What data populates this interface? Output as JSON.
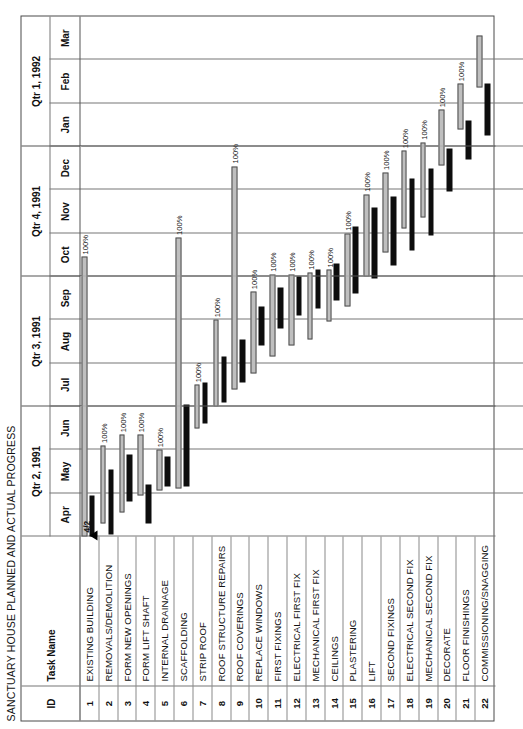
{
  "document": {
    "title": "SANCTUARY HOUSE PLANNED AND ACTUAL PROGRESS"
  },
  "table_headers": {
    "id": "ID",
    "task_name": "Task Name"
  },
  "milestone": {
    "label": "4/2",
    "marker": "triangle-up"
  },
  "timeline": {
    "quarters": [
      {
        "label": "Qtr 2, 1991",
        "months": [
          "Apr",
          "May",
          "Jun"
        ]
      },
      {
        "label": "Qtr 3, 1991",
        "months": [
          "Jul",
          "Aug",
          "Sep"
        ]
      },
      {
        "label": "Qtr 4, 1991",
        "months": [
          "Oct",
          "Nov",
          "Dec"
        ]
      },
      {
        "label": "Qtr 1, 1992",
        "months": [
          "Jan",
          "Feb",
          "Mar"
        ]
      }
    ],
    "months_flat": [
      "Apr",
      "May",
      "Jun",
      "Jul",
      "Aug",
      "Sep",
      "Oct",
      "Nov",
      "Dec",
      "Jan",
      "Feb",
      "Mar"
    ],
    "start": "Apr 1991",
    "end": "Mar 1992"
  },
  "legend": {
    "planned_color": "#bfbfbf",
    "actual_color": "#0d0d0d",
    "planned_label": "Planned",
    "actual_label": "Actual"
  },
  "chart_data": {
    "type": "bar",
    "title": "SANCTUARY HOUSE PLANNED AND ACTUAL PROGRESS",
    "xlabel": "",
    "ylabel": "Task Name",
    "orientation": "gantt",
    "x_unit": "month",
    "x": [
      "Apr",
      "May",
      "Jun",
      "Jul",
      "Aug",
      "Sep",
      "Oct",
      "Nov",
      "Dec",
      "Jan",
      "Feb",
      "Mar"
    ],
    "xlim": [
      0,
      12
    ],
    "grid": true,
    "legend": [
      "Planned",
      "Actual"
    ],
    "series": [
      {
        "name": "Planned",
        "color": "#bfbfbf"
      },
      {
        "name": "Actual",
        "color": "#0d0d0d"
      }
    ],
    "categories": [
      "EXISTING BUILDING",
      "REMOVALS/DEMOLITION",
      "FORM NEW OPENINGS",
      "FORM LIFT SHAFT",
      "INTERNAL DRAINAGE",
      "SCAFFOLDING",
      "STRIP ROOF",
      "ROOF STRUCTURE REPAIRS",
      "ROOF COVERINGS",
      "REPLACE WINDOWS",
      "FIRST FIXINGS",
      "ELECTRICAL FIRST FIX",
      "MECHANICAL FIRST FIX",
      "CEILINGS",
      "PLASTERING",
      "LIFT",
      "SECOND FIXINGS",
      "ELECTRICAL SECOND FIX",
      "MECHANICAL SECOND FIX",
      "DECORATE",
      "FLOOR FINISHINGS",
      "COMMISSIONING/SNAGGING"
    ],
    "tasks": [
      {
        "id": "1",
        "name": "EXISTING BUILDING",
        "planned_start": 0.0,
        "planned_end": 6.45,
        "actual_start": 0.0,
        "actual_end": 0.95,
        "percent": "100%"
      },
      {
        "id": "2",
        "name": "REMOVALS/DEMOLITION",
        "planned_start": 0.3,
        "planned_end": 2.1,
        "actual_start": 0.05,
        "actual_end": 1.55,
        "percent": "100%"
      },
      {
        "id": "3",
        "name": "FORM NEW OPENINGS",
        "planned_start": 0.55,
        "planned_end": 2.35,
        "actual_start": 0.8,
        "actual_end": 1.9,
        "percent": "100%"
      },
      {
        "id": "4",
        "name": "FORM LIFT SHAFT",
        "planned_start": 0.95,
        "planned_end": 2.35,
        "actual_start": 0.3,
        "actual_end": 1.2,
        "percent": "100%"
      },
      {
        "id": "5",
        "name": "INTERNAL DRAINAGE",
        "planned_start": 1.05,
        "planned_end": 2.0,
        "actual_start": 1.15,
        "actual_end": 1.85,
        "percent": "100%"
      },
      {
        "id": "6",
        "name": "SCAFFOLDING",
        "planned_start": 1.1,
        "planned_end": 6.9,
        "actual_start": 1.15,
        "actual_end": 3.05,
        "percent": "100%"
      },
      {
        "id": "7",
        "name": "STRIP ROOF",
        "planned_start": 2.5,
        "planned_end": 3.5,
        "actual_start": 2.6,
        "actual_end": 3.55,
        "percent": "100%"
      },
      {
        "id": "8",
        "name": "ROOF STRUCTURE REPAIRS",
        "planned_start": 3.0,
        "planned_end": 5.0,
        "actual_start": 3.1,
        "actual_end": 4.15,
        "percent": "100%"
      },
      {
        "id": "9",
        "name": "ROOF COVERINGS",
        "planned_start": 3.4,
        "planned_end": 8.55,
        "actual_start": 3.55,
        "actual_end": 4.55,
        "percent": "100%"
      },
      {
        "id": "10",
        "name": "REPLACE WINDOWS",
        "planned_start": 3.75,
        "planned_end": 5.65,
        "actual_start": 4.4,
        "actual_end": 5.3,
        "percent": "100%"
      },
      {
        "id": "11",
        "name": "FIRST FIXINGS",
        "planned_start": 4.15,
        "planned_end": 6.05,
        "actual_start": 4.8,
        "actual_end": 5.75,
        "percent": "100%"
      },
      {
        "id": "12",
        "name": "ELECTRICAL FIRST FIX",
        "planned_start": 4.4,
        "planned_end": 6.05,
        "actual_start": 5.1,
        "actual_end": 6.0,
        "percent": "100%"
      },
      {
        "id": "13",
        "name": "MECHANICAL FIRST FIX",
        "planned_start": 4.55,
        "planned_end": 6.1,
        "actual_start": 5.25,
        "actual_end": 6.15,
        "percent": "100%"
      },
      {
        "id": "14",
        "name": "CEILINGS",
        "planned_start": 4.95,
        "planned_end": 6.15,
        "actual_start": 5.45,
        "actual_end": 6.3,
        "percent": "100%"
      },
      {
        "id": "15",
        "name": "PLASTERING",
        "planned_start": 5.3,
        "planned_end": 7.0,
        "actual_start": 5.6,
        "actual_end": 7.15,
        "percent": "100%"
      },
      {
        "id": "16",
        "name": "LIFT",
        "planned_start": 6.0,
        "planned_end": 7.9,
        "actual_start": 5.95,
        "actual_end": 7.6,
        "percent": "100%"
      },
      {
        "id": "17",
        "name": "SECOND FIXINGS",
        "planned_start": 6.55,
        "planned_end": 8.4,
        "actual_start": 6.25,
        "actual_end": 7.85,
        "percent": "100%"
      },
      {
        "id": "18",
        "name": "ELECTRICAL SECOND FIX",
        "planned_start": 7.1,
        "planned_end": 8.9,
        "actual_start": 6.6,
        "actual_end": 8.25,
        "percent": "100%"
      },
      {
        "id": "19",
        "name": "MECHANICAL SECOND FIX",
        "planned_start": 7.35,
        "planned_end": 9.1,
        "actual_start": 6.95,
        "actual_end": 8.5,
        "percent": "100%"
      },
      {
        "id": "20",
        "name": "DECORATE",
        "planned_start": 8.55,
        "planned_end": 9.85,
        "actual_start": 7.95,
        "actual_end": 8.95,
        "percent": "100%"
      },
      {
        "id": "21",
        "name": "FLOOR FINISHINGS",
        "planned_start": 9.4,
        "planned_end": 10.45,
        "actual_start": 8.7,
        "actual_end": 9.6,
        "percent": "100%"
      },
      {
        "id": "22",
        "name": "COMMISSIONING/SNAGGING",
        "planned_start": 10.35,
        "planned_end": 11.55,
        "actual_start": 9.25,
        "actual_end": 10.45,
        "percent": ""
      }
    ]
  }
}
